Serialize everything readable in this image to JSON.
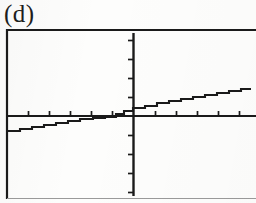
{
  "figure": {
    "panel_label": "(d)",
    "caption_position": "top-left",
    "ink_color": "#1a1a1a",
    "paper_color": "#fdfdfc",
    "frame": {
      "left": 6,
      "top": 29,
      "right": 256,
      "bottom": 199,
      "right_edge_visible": false,
      "bottom_edge_faint": true
    }
  },
  "chart_data": {
    "type": "line",
    "title": "(d)",
    "subtitle": "",
    "xlabel": "",
    "ylabel": "",
    "grid": false,
    "legend": null,
    "style": "staircase",
    "axes": {
      "x_axis_pixel_y": 116,
      "y_axis_pixel_x": 133,
      "x_axis_from": 7,
      "x_axis_to": 255,
      "y_axis_from": 33,
      "y_axis_to": 196,
      "x_ticks_pixel": [
        28,
        49,
        70,
        91,
        112,
        155,
        176,
        197,
        218,
        239
      ],
      "y_ticks_pixel": [
        40,
        59,
        78,
        97,
        135,
        154,
        173,
        192
      ],
      "tick_length": 5,
      "x_tick_side": "above",
      "y_tick_side": "left",
      "xlim": [
        -6,
        6
      ],
      "ylim": [
        -4,
        4
      ]
    },
    "x": [
      -6.0,
      -5.5,
      -5.1,
      -4.7,
      -4.2,
      -3.8,
      -3.4,
      -3.0,
      -2.6,
      -2.2,
      -1.8,
      -1.3,
      -0.9,
      -0.5,
      -0.1,
      0.3,
      0.7,
      1.1,
      1.5,
      1.9,
      2.3,
      2.7,
      3.1,
      3.5,
      3.9,
      4.3,
      4.7,
      5.1,
      5.5,
      5.9
    ],
    "y": [
      -0.36,
      -0.33,
      -0.29,
      -0.26,
      -0.22,
      -0.19,
      -0.15,
      -0.12,
      -0.08,
      -0.05,
      -0.03,
      -0.01,
      0.01,
      0.03,
      0.06,
      0.12,
      0.2,
      0.3,
      0.38,
      0.45,
      0.52,
      0.58,
      0.64,
      0.7,
      0.76,
      0.82,
      0.88,
      0.93,
      0.98,
      1.02
    ],
    "steps_pixel": [
      {
        "x0": 7,
        "x1": 20,
        "y": 131
      },
      {
        "x0": 20,
        "x1": 32,
        "y": 129
      },
      {
        "x0": 32,
        "x1": 44,
        "y": 127
      },
      {
        "x0": 44,
        "x1": 56,
        "y": 125
      },
      {
        "x0": 56,
        "x1": 68,
        "y": 123
      },
      {
        "x0": 68,
        "x1": 80,
        "y": 121
      },
      {
        "x0": 80,
        "x1": 93,
        "y": 119
      },
      {
        "x0": 93,
        "x1": 105,
        "y": 118
      },
      {
        "x0": 105,
        "x1": 116,
        "y": 117
      },
      {
        "x0": 116,
        "x1": 124,
        "y": 114
      },
      {
        "x0": 124,
        "x1": 133,
        "y": 111
      },
      {
        "x0": 133,
        "x1": 145,
        "y": 108
      },
      {
        "x0": 145,
        "x1": 157,
        "y": 106
      },
      {
        "x0": 157,
        "x1": 169,
        "y": 103
      },
      {
        "x0": 169,
        "x1": 181,
        "y": 101
      },
      {
        "x0": 181,
        "x1": 193,
        "y": 99
      },
      {
        "x0": 193,
        "x1": 205,
        "y": 97
      },
      {
        "x0": 205,
        "x1": 217,
        "y": 95
      },
      {
        "x0": 217,
        "x1": 229,
        "y": 93
      },
      {
        "x0": 229,
        "x1": 241,
        "y": 91
      },
      {
        "x0": 241,
        "x1": 251,
        "y": 89
      }
    ]
  }
}
